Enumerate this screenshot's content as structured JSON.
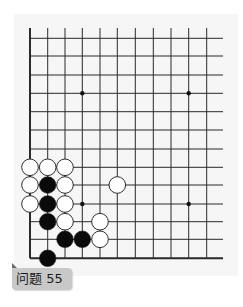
{
  "problem": {
    "label": "问题 55"
  },
  "board": {
    "columns_x": [
      30,
      47.7,
      65,
      82.3,
      100,
      117.3,
      135.3,
      153.3,
      171,
      188.7,
      206.7
    ],
    "rows_y": [
      38.3,
      56,
      75,
      93.3,
      111.7,
      130,
      149,
      167.3,
      185,
      204,
      221.7,
      239.3,
      258.3
    ],
    "top_y": 28,
    "right_x": 223,
    "line_color": "#2a2a2a",
    "stone_radius": 8.3,
    "star_points": [
      {
        "col": 3,
        "row": 3
      },
      {
        "col": 9,
        "row": 3
      },
      {
        "col": 3,
        "row": 9
      },
      {
        "col": 9,
        "row": 9
      }
    ],
    "stones": [
      {
        "color": "white",
        "col": 0,
        "row": 7
      },
      {
        "color": "white",
        "col": 1,
        "row": 7
      },
      {
        "color": "white",
        "col": 2,
        "row": 7
      },
      {
        "color": "white",
        "col": 0,
        "row": 8
      },
      {
        "color": "black",
        "col": 1,
        "row": 8
      },
      {
        "color": "white",
        "col": 2,
        "row": 8
      },
      {
        "color": "white",
        "col": 5,
        "row": 8
      },
      {
        "color": "white",
        "col": 0,
        "row": 9
      },
      {
        "color": "black",
        "col": 1,
        "row": 9
      },
      {
        "color": "white",
        "col": 2,
        "row": 9
      },
      {
        "color": "black",
        "col": 1,
        "row": 10
      },
      {
        "color": "white",
        "col": 2,
        "row": 10
      },
      {
        "color": "white",
        "col": 4,
        "row": 10
      },
      {
        "color": "black",
        "col": 2,
        "row": 11
      },
      {
        "color": "black",
        "col": 3,
        "row": 11
      },
      {
        "color": "white",
        "col": 4,
        "row": 11
      },
      {
        "color": "black",
        "col": 1,
        "row": 12
      }
    ]
  }
}
